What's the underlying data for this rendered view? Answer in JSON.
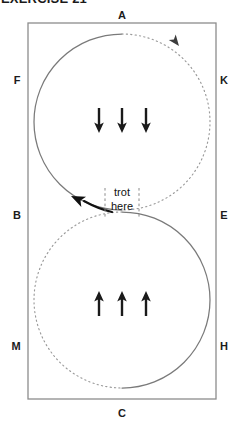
{
  "heading": {
    "text": "EXERCISE 21"
  },
  "diagram": {
    "arena": {
      "left": 28,
      "top": 23,
      "right": 216,
      "bottom": 399,
      "wall_color": "#8d8d8d"
    },
    "markers": [
      {
        "id": "marker-a",
        "label": "A",
        "x": 122,
        "y": 19,
        "side": "top"
      },
      {
        "id": "marker-f",
        "label": "F",
        "x": 17,
        "y": 84,
        "side": "left"
      },
      {
        "id": "marker-k",
        "label": "K",
        "x": 222,
        "y": 84,
        "side": "right"
      },
      {
        "id": "marker-b",
        "label": "B",
        "x": 17,
        "y": 219,
        "side": "left"
      },
      {
        "id": "marker-e",
        "label": "E",
        "x": 222,
        "y": 219,
        "side": "right"
      },
      {
        "id": "marker-m",
        "label": "M",
        "x": 15,
        "y": 350,
        "side": "left"
      },
      {
        "id": "marker-h",
        "label": "H",
        "x": 222,
        "y": 350,
        "side": "right"
      },
      {
        "id": "marker-c",
        "label": "C",
        "x": 122,
        "y": 417,
        "side": "bottom"
      }
    ],
    "circles": [
      {
        "id": "upper-circle",
        "cx": 122,
        "cy": 122,
        "r": 88,
        "solid_half": "left",
        "dotted_half": "right",
        "direction_arrow": {
          "x": 178,
          "y": 45,
          "rotation": 52
        }
      },
      {
        "id": "lower-circle",
        "cx": 122,
        "cy": 300,
        "r": 88,
        "solid_half": "right",
        "dotted_half": "left",
        "direction_arrow": {
          "x": 80,
          "y": 203,
          "rotation": 205
        }
      }
    ],
    "transition_zone": {
      "label_line_1": "trot",
      "label_line_2": "here",
      "left_x": 105,
      "right_x": 139,
      "top_y": 188,
      "bottom_y": 219,
      "label_x": 122,
      "label_y_1": 196,
      "label_y_2": 209
    },
    "gait_arrows": [
      {
        "id": "down-arrow-1",
        "direction": "down",
        "x": 99,
        "y_top": 108,
        "y_bottom": 133
      },
      {
        "id": "down-arrow-2",
        "direction": "down",
        "x": 122,
        "y_top": 108,
        "y_bottom": 133
      },
      {
        "id": "down-arrow-3",
        "direction": "down",
        "x": 146,
        "y_top": 108,
        "y_bottom": 133
      },
      {
        "id": "up-arrow-1",
        "direction": "up",
        "x": 99,
        "y_top": 291,
        "y_bottom": 316
      },
      {
        "id": "up-arrow-2",
        "direction": "up",
        "x": 122,
        "y_top": 291,
        "y_bottom": 316
      },
      {
        "id": "up-arrow-3",
        "direction": "up",
        "x": 146,
        "y_top": 291,
        "y_bottom": 316
      }
    ]
  }
}
